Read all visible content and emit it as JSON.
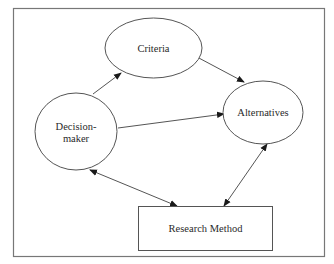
{
  "diagram": {
    "type": "conceptual-flow",
    "colors": {
      "background": "#ffffff",
      "stroke": "#555555",
      "frame": "#777777",
      "text": "#2a2a2a"
    },
    "nodes": {
      "criteria": {
        "label": "Criteria",
        "shape": "ellipse"
      },
      "alternatives": {
        "label": "Alternatives",
        "shape": "ellipse"
      },
      "decision_maker": {
        "label_line1": "Decision-",
        "label_line2": "maker",
        "shape": "circle"
      },
      "research_method": {
        "label": "Research Method",
        "shape": "rectangle"
      }
    },
    "edges": [
      {
        "from": "Decision-maker",
        "to": "Criteria",
        "direction": "forward"
      },
      {
        "from": "Criteria",
        "to": "Alternatives",
        "direction": "forward"
      },
      {
        "from": "Decision-maker",
        "to": "Alternatives",
        "direction": "forward"
      },
      {
        "from": "Decision-maker",
        "to": "Research Method",
        "direction": "bidirectional"
      },
      {
        "from": "Alternatives",
        "to": "Research Method",
        "direction": "bidirectional"
      }
    ]
  }
}
